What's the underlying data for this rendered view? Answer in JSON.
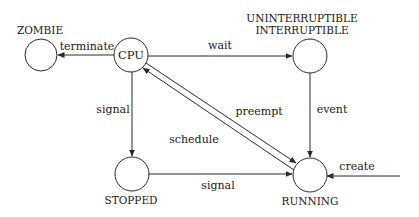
{
  "diagram": {
    "type": "state-transition",
    "colors": {
      "stroke": "#2a2a2a",
      "text": "#1a1a1a",
      "background": "#ffffff"
    },
    "states": [
      {
        "id": "zombie",
        "label": "ZOMBIE"
      },
      {
        "id": "cpu",
        "label": "CPU"
      },
      {
        "id": "blocked",
        "label_line1": "UNINTERRUPTIBLE",
        "label_line2": "INTERRUPTIBLE"
      },
      {
        "id": "stopped",
        "label": "STOPPED"
      },
      {
        "id": "running",
        "label": "RUNNING"
      }
    ],
    "transitions": [
      {
        "from": "cpu",
        "to": "zombie",
        "label": "terminate"
      },
      {
        "from": "cpu",
        "to": "blocked",
        "label": "wait"
      },
      {
        "from": "cpu",
        "to": "stopped",
        "label": "signal"
      },
      {
        "from": "blocked",
        "to": "running",
        "label": "event"
      },
      {
        "from": "cpu",
        "to": "running",
        "label": "preempt"
      },
      {
        "from": "running",
        "to": "cpu",
        "label": "schedule"
      },
      {
        "from": "stopped",
        "to": "running",
        "label": "signal"
      },
      {
        "from": "external",
        "to": "running",
        "label": "create"
      }
    ]
  }
}
